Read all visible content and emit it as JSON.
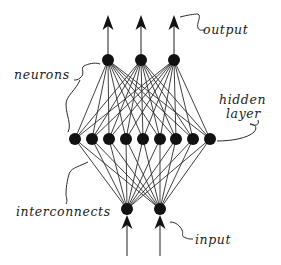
{
  "diagram": {
    "title": "",
    "type": "feed-forward neural network",
    "colors": {
      "ink": "#111111",
      "background": "#ffffff"
    },
    "layers": {
      "input": {
        "count": 2
      },
      "hidden": {
        "count": 9
      },
      "output": {
        "count": 3
      }
    },
    "labels": {
      "output": "output",
      "neurons": "neurons",
      "hidden_line1": "hidden",
      "hidden_line2": "layer",
      "interconnects": "interconnects",
      "input": "input"
    }
  }
}
